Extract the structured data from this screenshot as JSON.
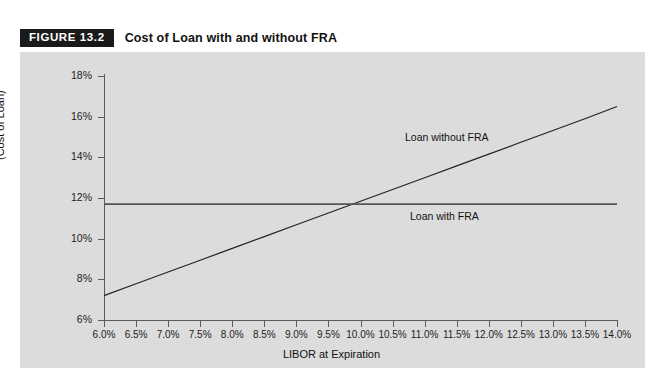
{
  "figure": {
    "badge": "FIGURE 13.2",
    "title": "Cost of Loan with and without FRA",
    "badge_bg": "#1a1a1a",
    "panel_bg": "#dcdcdc",
    "line_color": "#222222"
  },
  "chart_data": {
    "type": "line",
    "title": "Cost of Loan with and without FRA",
    "xlabel": "LIBOR at Expiration",
    "ylabel": "(Cost of Loan)",
    "xlim": [
      6.0,
      14.0
    ],
    "ylim": [
      6,
      18
    ],
    "grid": false,
    "legend": "inline-annotations",
    "x": [
      6.0,
      6.5,
      7.0,
      7.5,
      8.0,
      8.5,
      9.0,
      9.5,
      10.0,
      10.5,
      11.0,
      11.5,
      12.0,
      12.5,
      13.0,
      13.5,
      14.0
    ],
    "xtick_labels": [
      "6.0%",
      "6.5%",
      "7.0%",
      "7.5%",
      "8.0%",
      "8.5%",
      "9.0%",
      "9.5%",
      "10.0%",
      "10.5%",
      "11.0%",
      "11.5%",
      "12.0%",
      "12.5%",
      "13.0%",
      "13.5%",
      "14.0%"
    ],
    "ytick_values": [
      6,
      8,
      10,
      12,
      14,
      16,
      18
    ],
    "ytick_labels": [
      "6%",
      "8%",
      "10%",
      "12%",
      "14%",
      "16%",
      "18%"
    ],
    "series": [
      {
        "name": "Loan without FRA",
        "annotation": "Loan without FRA",
        "values": [
          7.2,
          7.78,
          8.36,
          8.94,
          9.52,
          10.1,
          10.68,
          11.26,
          11.84,
          12.42,
          13.0,
          13.58,
          14.16,
          14.74,
          15.32,
          15.9,
          16.5
        ]
      },
      {
        "name": "Loan with FRA",
        "annotation": "Loan with FRA",
        "values": [
          11.7,
          11.7,
          11.7,
          11.7,
          11.7,
          11.7,
          11.7,
          11.7,
          11.7,
          11.7,
          11.7,
          11.7,
          11.7,
          11.7,
          11.7,
          11.7,
          11.7
        ]
      }
    ]
  }
}
